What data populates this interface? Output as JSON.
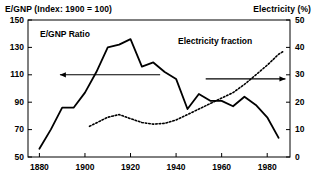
{
  "chart_data": {
    "type": "line",
    "title": "",
    "axis_titles": {
      "left": "E/GNP (Index: 1900 = 100)",
      "right": "Electricity (%)",
      "xlabel": ""
    },
    "xlim": [
      1875,
      1990
    ],
    "xticks": [
      1880,
      1900,
      1920,
      1940,
      1960,
      1980
    ],
    "xticklabels": [
      "1880",
      "1900",
      "1920",
      "1940",
      "1960",
      "1980"
    ],
    "left_axis": {
      "ylim": [
        50,
        150
      ],
      "yticks": [
        50,
        70,
        90,
        110,
        130,
        150
      ],
      "yticklabels": [
        "50",
        "70",
        "90",
        "110",
        "130",
        "150"
      ]
    },
    "right_axis": {
      "ylim": [
        0,
        50
      ],
      "yticks": [
        0,
        10,
        20,
        30,
        40,
        50
      ],
      "yticklabels": [
        "0",
        "10",
        "20",
        "30",
        "40",
        "50"
      ]
    },
    "grid": false,
    "legend": "inline-labels",
    "series": [
      {
        "name": "E/GNP Ratio",
        "label": "E/GNP Ratio",
        "axis": "left",
        "style": "solid",
        "color": "#000000",
        "x": [
          1880,
          1885,
          1890,
          1895,
          1900,
          1905,
          1910,
          1915,
          1920,
          1925,
          1930,
          1935,
          1940,
          1945,
          1950,
          1955,
          1960,
          1965,
          1970,
          1975,
          1980,
          1985
        ],
        "values": [
          56,
          70,
          86,
          86,
          97,
          112,
          130,
          132,
          136,
          116,
          119,
          112,
          107,
          85,
          96,
          91,
          91,
          87,
          94,
          88,
          79,
          64
        ]
      },
      {
        "name": "Electricity fraction",
        "label": "Electricity fraction",
        "axis": "right",
        "style": "dotted",
        "color": "#000000",
        "x": [
          1902,
          1910,
          1915,
          1920,
          1925,
          1930,
          1935,
          1940,
          1945,
          1950,
          1955,
          1960,
          1965,
          1970,
          1975,
          1980,
          1985,
          1987
        ],
        "values": [
          11.2,
          14.5,
          15.5,
          14.0,
          12.6,
          12.0,
          12.3,
          13.5,
          15.5,
          17.5,
          19.5,
          21.5,
          23.5,
          26.5,
          30.0,
          33.5,
          37.5,
          38.5
        ]
      }
    ],
    "annotations": [
      {
        "name": "left-axis-arrow",
        "type": "arrow",
        "direction": "left",
        "from": [
          1933,
          110
        ],
        "to": [
          1889,
          110
        ]
      },
      {
        "name": "right-axis-arrow",
        "type": "arrow",
        "direction": "right",
        "from": [
          1953,
          107
        ],
        "to": [
          1988,
          107
        ]
      }
    ]
  }
}
